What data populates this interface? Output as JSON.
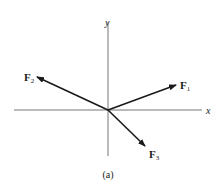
{
  "diagram": {
    "type": "force-vector-diagram",
    "caption": "(a)",
    "colors": {
      "axis": "#777777",
      "vector": "#1a1a1a",
      "background": "#ffffff"
    },
    "axes": {
      "x_label": "x",
      "y_label": "y",
      "origin": [
        108,
        110
      ],
      "x_extent": [
        14,
        202
      ],
      "y_extent": [
        22,
        156
      ]
    },
    "vectors": [
      {
        "id": "F1",
        "name": "F",
        "subscript": "1",
        "tip": [
          176,
          85
        ],
        "label_pos": [
          180,
          89
        ]
      },
      {
        "id": "F2",
        "name": "F",
        "subscript": "2",
        "tip": [
          37,
          77
        ],
        "label_pos": [
          25,
          81
        ]
      },
      {
        "id": "F3",
        "name": "F",
        "subscript": "3",
        "tip": [
          145,
          146
        ],
        "label_pos": [
          149,
          158
        ]
      }
    ]
  }
}
